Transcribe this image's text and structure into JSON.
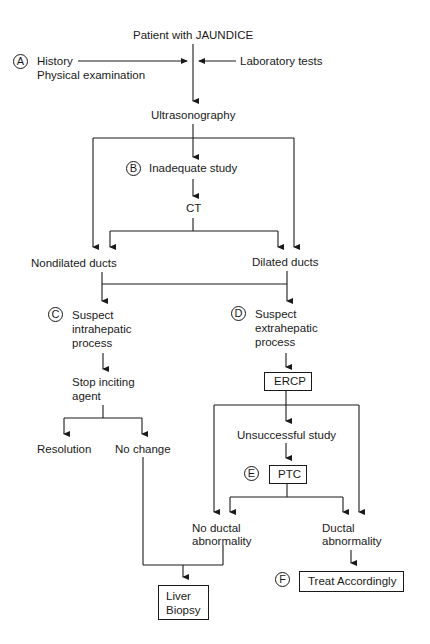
{
  "diagram": {
    "title": "Patient with JAUNDICE",
    "markers": {
      "A": "A",
      "B": "B",
      "C": "C",
      "D": "D",
      "E": "E",
      "F": "F"
    },
    "nodes": {
      "history_line1": "History",
      "history_line2": "Physical examination",
      "lab_tests": "Laboratory tests",
      "ultrasonography": "Ultrasonography",
      "inadequate_study": "Inadequate study",
      "ct": "CT",
      "nondilated_ducts": "Nondilated ducts",
      "dilated_ducts": "Dilated ducts",
      "suspect_intra_1": "Suspect",
      "suspect_intra_2": "intrahepatic",
      "suspect_intra_3": "process",
      "suspect_extra_1": "Suspect",
      "suspect_extra_2": "extrahepatic",
      "suspect_extra_3": "process",
      "stop_inciting_1": "Stop inciting",
      "stop_inciting_2": "agent",
      "ercp": "ERCP",
      "resolution": "Resolution",
      "no_change": "No change",
      "unsuccessful_study": "Unsuccessful study",
      "ptc": "PTC",
      "no_ductal_1": "No ductal",
      "no_ductal_2": "abnormality",
      "ductal_1": "Ductal",
      "ductal_2": "abnormality",
      "treat": "Treat Accordingly",
      "liver_biopsy_1": "Liver",
      "liver_biopsy_2": "Biopsy"
    }
  }
}
